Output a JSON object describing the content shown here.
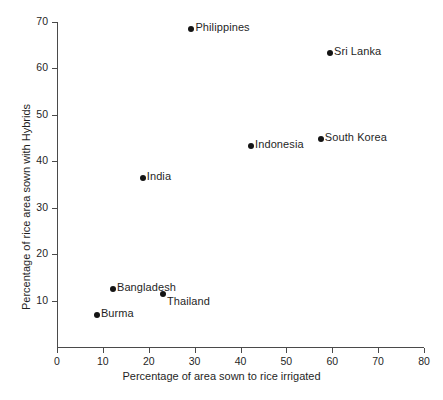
{
  "chart_data": {
    "type": "scatter",
    "title": "",
    "xlabel": "Percentage of area sown to rice irrigated",
    "ylabel": "Percentage  of  rice area sown with Hybrids",
    "xlim": [
      0,
      80
    ],
    "ylim": [
      0,
      70
    ],
    "xticks": [
      "0",
      "10",
      "20",
      "30",
      "40",
      "50",
      "60",
      "70",
      "80"
    ],
    "xtick_values": [
      0,
      10,
      20,
      30,
      40,
      50,
      60,
      70,
      80
    ],
    "yticks": [
      "10",
      "20",
      "30",
      "40",
      "50",
      "60",
      "70"
    ],
    "ytick_values": [
      10,
      20,
      30,
      40,
      50,
      60,
      70
    ],
    "grid": false,
    "legend": "none",
    "marker_color": "#141414",
    "axis_color": "#4a4a4a",
    "background": "#ffffff",
    "points": [
      {
        "label": "Burma",
        "x": 8.7,
        "y": 7.0,
        "label_pos": "right"
      },
      {
        "label": "Bangladesh",
        "x": 12.2,
        "y": 12.6,
        "label_pos": "right"
      },
      {
        "label": "Thailand",
        "x": 23.1,
        "y": 11.5,
        "label_pos": "below-right"
      },
      {
        "label": "India",
        "x": 18.7,
        "y": 36.5,
        "label_pos": "right"
      },
      {
        "label": "Indonesia",
        "x": 42.3,
        "y": 43.2,
        "label_pos": "right"
      },
      {
        "label": "South Korea",
        "x": 57.5,
        "y": 44.9,
        "label_pos": "right"
      },
      {
        "label": "Philippines",
        "x": 29.3,
        "y": 68.4,
        "label_pos": "right"
      },
      {
        "label": "Sri Lanka",
        "x": 59.5,
        "y": 63.4,
        "label_pos": "right"
      }
    ]
  }
}
